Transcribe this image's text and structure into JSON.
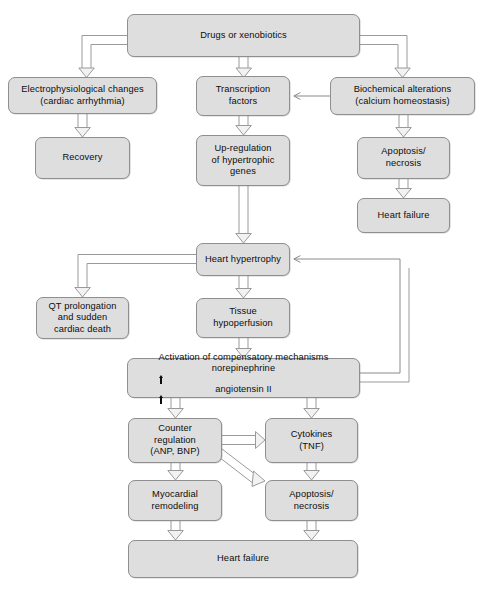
{
  "diagram": {
    "box_fill": "#dedede",
    "box_stroke": "#8f8f8f",
    "arrow_stroke": "#9a9a9a",
    "text_color": "#0d0d0d",
    "background": "#ffffff"
  },
  "nodes": {
    "drugs_or_xenobiotics": "Drugs or xenobiotics",
    "electrophysiological_changes_line1": "Electrophysiological changes",
    "electrophysiological_changes_line2": "(cardiac arrhythmia)",
    "transcription_factors_line1": "Transcription",
    "transcription_factors_line2": "factors",
    "biochemical_alterations_line1": "Biochemical alterations",
    "biochemical_alterations_line2": "(calcium homeostasis)",
    "recovery": "Recovery",
    "up_regulation_line1": "Up-regulation",
    "up_regulation_line2": "of hypertrophic",
    "up_regulation_line3": "genes",
    "apoptosis_necrosis_top_line1": "Apoptosis/",
    "apoptosis_necrosis_top_line2": "necrosis",
    "heart_failure_top": "Heart failure",
    "heart_hypertrophy": "Heart hypertrophy",
    "qt_prolongation_line1": "QT prolongation",
    "qt_prolongation_line2": "and sudden",
    "qt_prolongation_line3": "cardiac death",
    "tissue_hypoperfusion_line1": "Tissue",
    "tissue_hypoperfusion_line2": "hypoperfusion",
    "activation_line1": "Activation of compensatory mechanisms",
    "activation_line2_part1": "norepinephrine",
    "activation_line2_part2": "angiotensin II",
    "counter_regulation_line1": "Counter",
    "counter_regulation_line2": "regulation",
    "counter_regulation_line3": "(ANP, BNP)",
    "cytokines_line1": "Cytokines",
    "cytokines_line2": "(TNF)",
    "myocardial_remodeling_line1": "Myocardial",
    "myocardial_remodeling_line2": "remodeling",
    "apoptosis_necrosis_bottom_line1": "Apoptosis/",
    "apoptosis_necrosis_bottom_line2": "necrosis",
    "heart_failure_bottom": "Heart failure"
  }
}
